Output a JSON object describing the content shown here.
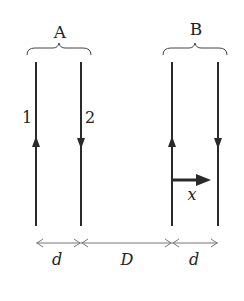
{
  "diagram": {
    "groups": [
      {
        "label": "A",
        "wires": [
          {
            "label": "1",
            "current_direction": "up"
          },
          {
            "label": "2",
            "current_direction": "down"
          }
        ]
      },
      {
        "label": "B",
        "wires": [
          {
            "label": "",
            "current_direction": "up"
          },
          {
            "label": "",
            "current_direction": "down"
          }
        ]
      }
    ],
    "displacement_label": "x",
    "dimensions": [
      {
        "label": "d"
      },
      {
        "label": "D"
      },
      {
        "label": "d"
      }
    ],
    "colors": {
      "line": "#2a2a2a",
      "dimension": "#777777"
    }
  }
}
